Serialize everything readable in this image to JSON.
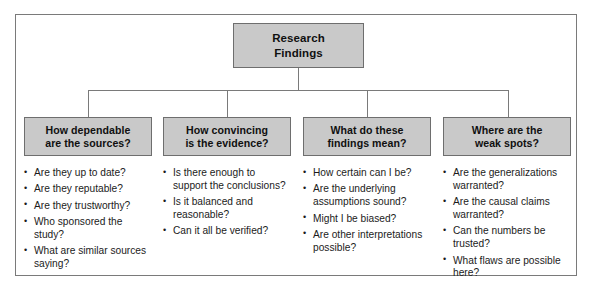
{
  "diagram": {
    "type": "tree",
    "colors": {
      "box_fill": "#c9c9c9",
      "box_border": "#6e6e6e",
      "frame_border": "#7a7a7a",
      "text": "#101010",
      "background": "#ffffff"
    },
    "root": {
      "line1": "Research",
      "line2": "Findings"
    },
    "branches": [
      {
        "header_line1": "How dependable",
        "header_line2": "are the sources?",
        "items": [
          "Are they up to date?",
          "Are they reputable?",
          "Are they trustworthy?",
          "Who sponsored the study?",
          "What are similar sources saying?"
        ]
      },
      {
        "header_line1": "How convincing",
        "header_line2": "is the evidence?",
        "items": [
          "Is there enough to support the conclusions?",
          "Is it balanced and reasonable?",
          "Can it all be verified?"
        ]
      },
      {
        "header_line1": "What do these",
        "header_line2": "findings mean?",
        "items": [
          "How certain can I be?",
          "Are the underlying assumptions sound?",
          "Might I be biased?",
          "Are other interpretations possible?"
        ]
      },
      {
        "header_line1": "Where are the",
        "header_line2": "weak spots?",
        "items": [
          "Are the generalizations warranted?",
          "Are the causal claims warranted?",
          "Can the numbers be trusted?",
          "What flaws are possible here?"
        ]
      }
    ]
  }
}
